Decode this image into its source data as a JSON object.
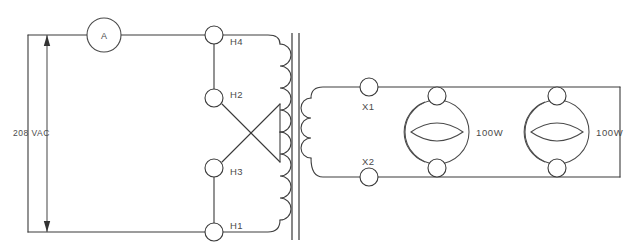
{
  "diagram": {
    "type": "electrical-schematic",
    "supply": {
      "voltage_label": "208 VAC",
      "meter_label": "A",
      "meter_name": "ammeter"
    },
    "primary": {
      "name": "primary-winding",
      "terminals": [
        {
          "id": "H4",
          "label": "H4",
          "x": 214,
          "y": 35
        },
        {
          "id": "H2",
          "label": "H2",
          "x": 214,
          "y": 98
        },
        {
          "id": "H3",
          "label": "H3",
          "x": 214,
          "y": 168
        },
        {
          "id": "H1",
          "label": "H1",
          "x": 214,
          "y": 232
        }
      ]
    },
    "secondary": {
      "name": "secondary-winding",
      "terminals": [
        {
          "id": "X1",
          "label": "X1",
          "x": 369,
          "y": 87
        },
        {
          "id": "X2",
          "label": "X2",
          "x": 369,
          "y": 177
        }
      ]
    },
    "loads": [
      {
        "id": "lamp-1",
        "label": "100W",
        "cx": 437,
        "cy": 132
      },
      {
        "id": "lamp-2",
        "label": "100W",
        "cx": 557,
        "cy": 132
      }
    ],
    "colors": {
      "wire": "#3a3a3a",
      "core": "#555555",
      "text": "#4b4b4b",
      "background": "#ffffff"
    }
  }
}
